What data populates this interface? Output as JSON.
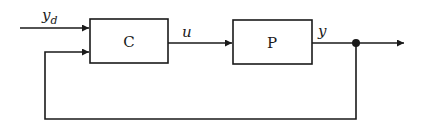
{
  "diagram": {
    "type": "feedback-control-block-diagram",
    "blocks": [
      {
        "id": "controller",
        "label": "C"
      },
      {
        "id": "plant",
        "label": "P"
      }
    ],
    "signals": {
      "reference": {
        "symbol": "y",
        "subscript": "d"
      },
      "control": {
        "symbol": "u"
      },
      "output": {
        "symbol": "y"
      }
    },
    "connections": [
      {
        "from": "reference",
        "to": "controller"
      },
      {
        "from": "controller",
        "to": "plant",
        "signal": "u"
      },
      {
        "from": "plant",
        "to": "output",
        "signal": "y"
      },
      {
        "from": "output",
        "to": "controller",
        "kind": "feedback"
      }
    ],
    "colors": {
      "ink": "#1a1a1a",
      "background": "#ffffff"
    }
  }
}
